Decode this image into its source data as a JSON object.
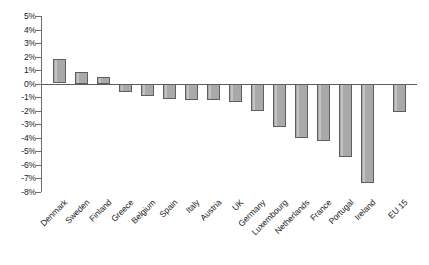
{
  "chart_data": {
    "type": "bar",
    "title": "",
    "subtitle": "",
    "xlabel": "",
    "ylabel": "",
    "ylim": [
      -8,
      5
    ],
    "grid": false,
    "legend": "none",
    "y_tick_labels": [
      "5%",
      "4%",
      "3%",
      "2%",
      "1%",
      "0%",
      "-1%",
      "-2%",
      "-3%",
      "-4%",
      "-5%",
      "-6%",
      "-7%",
      "-8%"
    ],
    "y_tick_values": [
      5,
      4,
      3,
      2,
      1,
      0,
      -1,
      -2,
      -3,
      -4,
      -5,
      -6,
      -7,
      -8
    ],
    "categories": [
      "Denmark",
      "Sweden",
      "Finland",
      "Greece",
      "Belgium",
      "Spain",
      "Italy",
      "Austria",
      "UK",
      "Germany",
      "Luxembourg",
      "Netherlands",
      "France",
      "Portugal",
      "Ireland",
      "EU 15"
    ],
    "values": [
      1.8,
      0.85,
      0.5,
      -0.6,
      -0.9,
      -1.1,
      -1.2,
      -1.2,
      -1.3,
      -2.0,
      -3.2,
      -4.0,
      -4.2,
      -5.4,
      -7.3,
      -2.1
    ],
    "bar_color": "#a9a9a9",
    "bar_border_color": "#5e5e5e",
    "axis_color": "#5c5c5c",
    "text_color": "#1a1a1a"
  }
}
